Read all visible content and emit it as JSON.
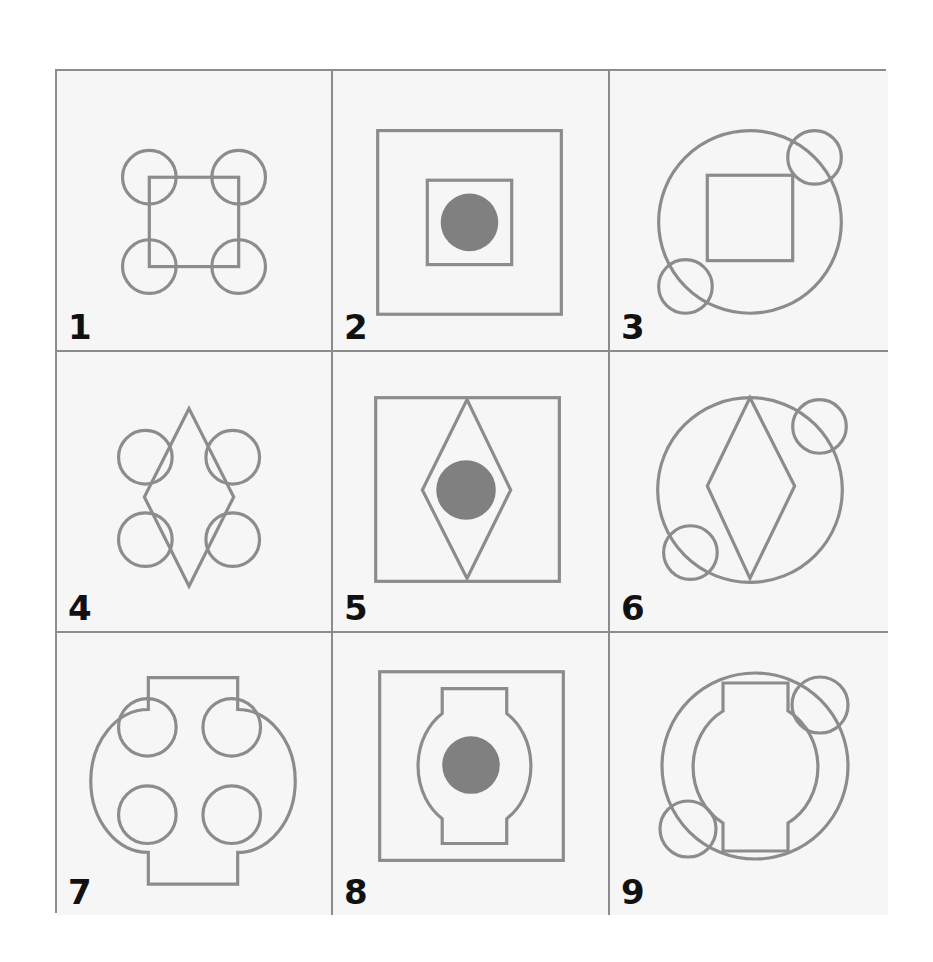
{
  "page": {
    "background_color": "#ffffff",
    "cell_background_color": "#f6f6f6",
    "grid_line_color": "#8c8c8c",
    "shape_stroke_color": "#8c8c8c",
    "shape_fill_color": "#808080",
    "label_color": "#111111",
    "rows": 3,
    "columns": 3
  },
  "cells": [
    {
      "label": "1",
      "row": 1,
      "column": 1,
      "outer_shape": "none",
      "main_shape": "square",
      "accent": "four-corner-circles",
      "center_dot": false
    },
    {
      "label": "2",
      "row": 1,
      "column": 2,
      "outer_shape": "square",
      "main_shape": "square",
      "accent": "none",
      "center_dot": true
    },
    {
      "label": "3",
      "row": 1,
      "column": 3,
      "outer_shape": "circle",
      "main_shape": "square",
      "accent": "two-diagonal-circles",
      "center_dot": false
    },
    {
      "label": "4",
      "row": 2,
      "column": 1,
      "outer_shape": "none",
      "main_shape": "diamond",
      "accent": "four-corner-circles",
      "center_dot": false
    },
    {
      "label": "5",
      "row": 2,
      "column": 2,
      "outer_shape": "square",
      "main_shape": "diamond",
      "accent": "none",
      "center_dot": true
    },
    {
      "label": "6",
      "row": 2,
      "column": 3,
      "outer_shape": "circle",
      "main_shape": "diamond",
      "accent": "two-diagonal-circles",
      "center_dot": false
    },
    {
      "label": "7",
      "row": 3,
      "column": 1,
      "outer_shape": "none",
      "main_shape": "barrel",
      "accent": "four-corner-circles",
      "center_dot": false
    },
    {
      "label": "8",
      "row": 3,
      "column": 2,
      "outer_shape": "square",
      "main_shape": "barrel",
      "accent": "none",
      "center_dot": true
    },
    {
      "label": "9",
      "row": 3,
      "column": 3,
      "outer_shape": "circle",
      "main_shape": "barrel",
      "accent": "two-diagonal-circles",
      "center_dot": false
    }
  ]
}
